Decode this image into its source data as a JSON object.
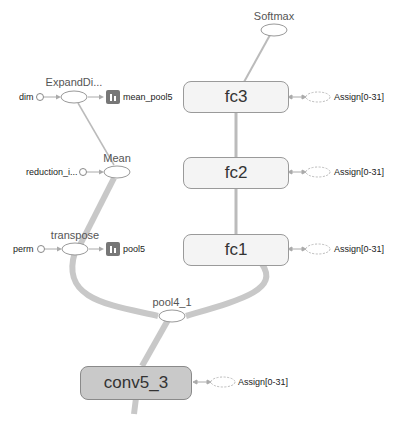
{
  "graph": {
    "nodes": {
      "softmax": {
        "label": "Softmax"
      },
      "expand_dims": {
        "label": "ExpandDi..."
      },
      "dim": {
        "label": "dim"
      },
      "mean_pool5": {
        "label": "mean_pool5"
      },
      "mean": {
        "label": "Mean"
      },
      "reduction_indices": {
        "label": "reduction_i..."
      },
      "transpose": {
        "label": "transpose"
      },
      "perm": {
        "label": "perm"
      },
      "pool5": {
        "label": "pool5"
      },
      "pool4_1": {
        "label": "pool4_1"
      },
      "fc3": {
        "label": "fc3"
      },
      "fc2": {
        "label": "fc2"
      },
      "fc1": {
        "label": "fc1"
      },
      "conv5_3": {
        "label": "conv5_3"
      }
    },
    "assign_labels": {
      "fc3": "Assign[0-31]",
      "fc2": "Assign[0-31]",
      "fc1": "Assign[0-31]",
      "conv5_3": "Assign[0-31]"
    },
    "edge_labels": {
      "fc3_softmax": "?×1000",
      "fc2_fc3": "?×4096",
      "fc1_fc2": "?×4096",
      "pool4_fc1": "?×7×7×512",
      "pool4_transpose": "?×512×7×7",
      "transpose_mean": "?×512×7×7",
      "mean_expand": "?×512",
      "conv_pool4": "?×14×14×512",
      "conv_in": "512"
    }
  }
}
